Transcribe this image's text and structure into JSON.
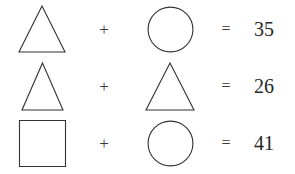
{
  "puzzle": {
    "title": "Shape equation puzzle",
    "background_color": "#ffffff",
    "stroke_color": "#333333",
    "text_color": "#262626",
    "operator_plus": "+",
    "operator_equals": "=",
    "rows": [
      {
        "left_shape": "triangle",
        "operator": "+",
        "right_shape": "circle",
        "equals": "=",
        "result": "35"
      },
      {
        "left_shape": "triangle",
        "operator": "+",
        "right_shape": "triangle",
        "equals": "=",
        "result": "26"
      },
      {
        "left_shape": "square",
        "operator": "+",
        "right_shape": "circle",
        "equals": "=",
        "result": "41"
      }
    ]
  }
}
